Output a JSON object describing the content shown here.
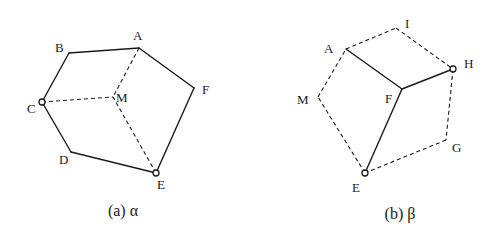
{
  "figures": [
    {
      "id": "alpha",
      "caption": "(a) α",
      "nodes": [
        {
          "name": "A",
          "label": "A"
        },
        {
          "name": "B",
          "label": "B"
        },
        {
          "name": "C",
          "label": "C"
        },
        {
          "name": "D",
          "label": "D"
        },
        {
          "name": "E",
          "label": "E"
        },
        {
          "name": "F",
          "label": "F"
        },
        {
          "name": "M",
          "label": "M"
        }
      ],
      "solid_edges": [
        [
          "A",
          "B"
        ],
        [
          "B",
          "C"
        ],
        [
          "C",
          "D"
        ],
        [
          "D",
          "E"
        ],
        [
          "E",
          "F"
        ],
        [
          "F",
          "A"
        ]
      ],
      "dashed_edges": [
        [
          "A",
          "M"
        ],
        [
          "C",
          "M"
        ],
        [
          "E",
          "M"
        ]
      ],
      "open_circle_nodes": [
        "C",
        "E"
      ]
    },
    {
      "id": "beta",
      "caption": "(b) β",
      "nodes": [
        {
          "name": "A",
          "label": "A"
        },
        {
          "name": "I",
          "label": "I"
        },
        {
          "name": "H",
          "label": "H"
        },
        {
          "name": "F",
          "label": "F"
        },
        {
          "name": "M",
          "label": "M"
        },
        {
          "name": "G",
          "label": "G"
        },
        {
          "name": "E",
          "label": "E"
        }
      ],
      "solid_edges": [
        [
          "A",
          "F"
        ],
        [
          "F",
          "H"
        ],
        [
          "F",
          "E"
        ]
      ],
      "dashed_edges": [
        [
          "A",
          "I"
        ],
        [
          "I",
          "H"
        ],
        [
          "H",
          "G"
        ],
        [
          "G",
          "E"
        ],
        [
          "E",
          "M"
        ],
        [
          "M",
          "A"
        ]
      ],
      "open_circle_nodes": [
        "H",
        "E"
      ]
    }
  ]
}
